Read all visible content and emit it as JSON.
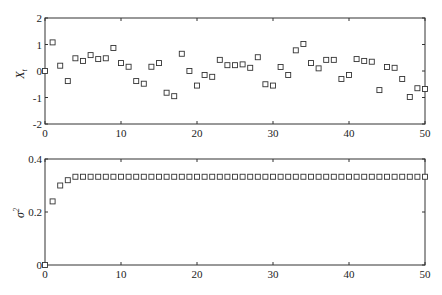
{
  "chart_data": [
    {
      "type": "scatter",
      "title": "",
      "xlabel": "",
      "ylabel": "X_t",
      "xlim": [
        0,
        50
      ],
      "ylim": [
        -2,
        2
      ],
      "xticks": [
        0,
        10,
        20,
        30,
        40,
        50
      ],
      "yticks": [
        -2,
        -1,
        0,
        1,
        2
      ],
      "xtick_labels": [
        "0",
        "10",
        "20",
        "30",
        "40",
        "50"
      ],
      "ytick_labels": [
        "-2",
        "-1",
        "0",
        "1",
        "2"
      ],
      "marker": "open-square",
      "grid": false,
      "legend": null,
      "x": [
        0,
        1,
        2,
        3,
        4,
        5,
        6,
        7,
        8,
        9,
        10,
        11,
        12,
        13,
        14,
        15,
        16,
        17,
        18,
        19,
        20,
        21,
        22,
        23,
        24,
        25,
        26,
        27,
        28,
        29,
        30,
        31,
        32,
        33,
        34,
        35,
        36,
        37,
        38,
        39,
        40,
        41,
        42,
        43,
        44,
        45,
        46,
        47,
        48,
        49,
        50
      ],
      "y": [
        0.0,
        1.08,
        0.2,
        -0.38,
        0.48,
        0.38,
        0.6,
        0.45,
        0.48,
        0.87,
        0.3,
        0.16,
        -0.38,
        -0.48,
        0.16,
        0.3,
        -0.82,
        -0.95,
        0.65,
        0.0,
        -0.55,
        -0.15,
        -0.22,
        0.42,
        0.22,
        0.22,
        0.25,
        0.12,
        0.52,
        -0.5,
        -0.55,
        0.15,
        -0.15,
        0.78,
        1.02,
        0.3,
        0.1,
        0.42,
        0.42,
        -0.3,
        -0.15,
        0.45,
        0.38,
        0.35,
        -0.72,
        0.15,
        0.12,
        -0.3,
        -0.98,
        -0.65,
        -0.68
      ]
    },
    {
      "type": "scatter",
      "title": "",
      "xlabel": "",
      "ylabel": "σ_t^2",
      "xlim": [
        0,
        50
      ],
      "ylim": [
        0,
        0.4
      ],
      "xticks": [
        0,
        10,
        20,
        30,
        40,
        50
      ],
      "yticks": [
        0,
        0.2,
        0.4
      ],
      "xtick_labels": [
        "0",
        "10",
        "20",
        "30",
        "40",
        "50"
      ],
      "ytick_labels": [
        "0",
        "0.2",
        "0.4"
      ],
      "marker": "open-square",
      "grid": false,
      "legend": null,
      "x": [
        0,
        1,
        2,
        3,
        4,
        5,
        6,
        7,
        8,
        9,
        10,
        11,
        12,
        13,
        14,
        15,
        16,
        17,
        18,
        19,
        20,
        21,
        22,
        23,
        24,
        25,
        26,
        27,
        28,
        29,
        30,
        31,
        32,
        33,
        34,
        35,
        36,
        37,
        38,
        39,
        40,
        41,
        42,
        43,
        44,
        45,
        46,
        47,
        48,
        49,
        50
      ],
      "y": [
        0.0,
        0.24,
        0.3,
        0.32,
        0.333,
        0.333,
        0.333,
        0.333,
        0.333,
        0.333,
        0.333,
        0.333,
        0.333,
        0.333,
        0.333,
        0.333,
        0.333,
        0.333,
        0.333,
        0.333,
        0.333,
        0.333,
        0.333,
        0.333,
        0.333,
        0.333,
        0.333,
        0.333,
        0.333,
        0.333,
        0.333,
        0.333,
        0.333,
        0.333,
        0.333,
        0.333,
        0.333,
        0.333,
        0.333,
        0.333,
        0.333,
        0.333,
        0.333,
        0.333,
        0.333,
        0.333,
        0.333,
        0.333,
        0.333,
        0.333,
        0.333
      ]
    }
  ],
  "labels": {
    "top_ylabel_main": "X",
    "top_ylabel_sub": "t",
    "bottom_ylabel_main": "σ",
    "bottom_ylabel_sub": "t",
    "bottom_ylabel_sup": "2"
  },
  "colors": {
    "axis": "#333333",
    "marker": "#333333",
    "background": "#ffffff"
  }
}
